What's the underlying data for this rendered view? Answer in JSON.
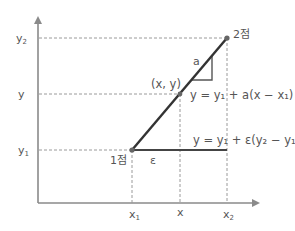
{
  "diagram": {
    "type": "linear-interpolation",
    "colors": {
      "axis": "#8a8a8a",
      "line": "#333333",
      "guide": "#9a9a9a",
      "text": "#555555",
      "point": "#666666"
    },
    "axes": {
      "y_labels": {
        "y2": "y",
        "y2_sub": "2",
        "y": "y",
        "y1": "y",
        "y1_sub": "1"
      },
      "x_labels": {
        "x1": "x",
        "x1_sub": "1",
        "x": "x",
        "x2": "x",
        "x2_sub": "2"
      }
    },
    "points": {
      "p1_label": "1점",
      "p2_label": "2점",
      "mid_label": "(x, y)"
    },
    "slope_label": "a",
    "epsilon_label": "ε",
    "equations": {
      "interp": "y = y₁ + a(x − x₁)",
      "eps": "y = y₁ + ε(y₂ − y₁)"
    }
  }
}
